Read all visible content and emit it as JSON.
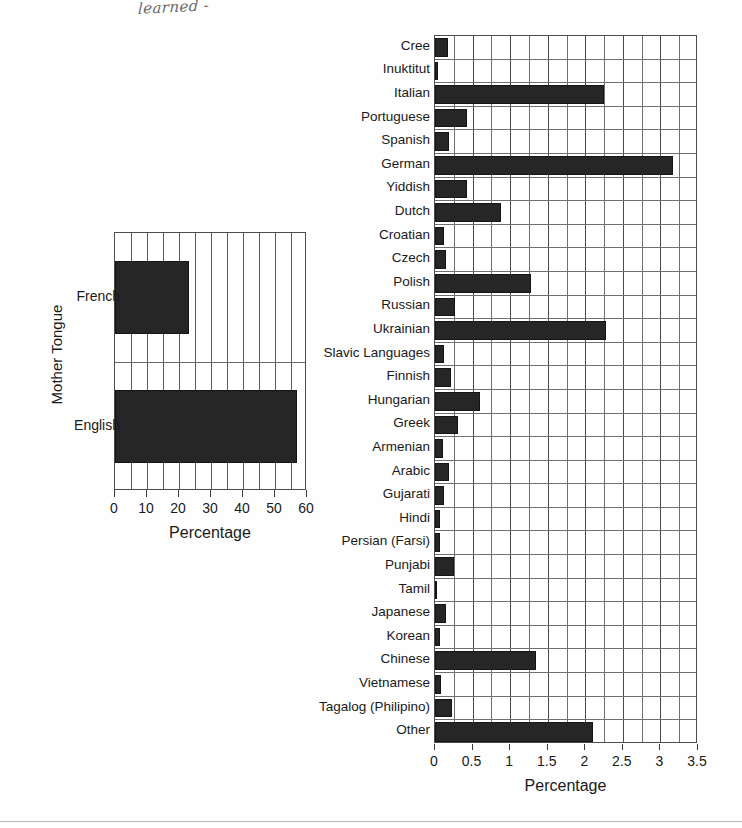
{
  "annotation": {
    "handwritten_note": "learned -"
  },
  "chart_data": [
    {
      "id": "mother-tongue-summary",
      "type": "bar",
      "orientation": "horizontal",
      "title": "",
      "xlabel": "Percentage",
      "ylabel": "Mother Tongue",
      "categories": [
        "French",
        "English"
      ],
      "values": [
        23,
        57
      ],
      "xlim": [
        0,
        60
      ],
      "xticks": [
        0,
        10,
        20,
        30,
        40,
        50,
        60
      ],
      "xtick_labels": [
        "0",
        "10",
        "20",
        "30",
        "40",
        "50",
        "60"
      ],
      "minor_gridline_step": 5,
      "grid": true,
      "legend": "none",
      "bar_color": "#262626"
    },
    {
      "id": "mother-tongue-detail",
      "type": "bar",
      "orientation": "horizontal",
      "title": "",
      "xlabel": "Percentage",
      "ylabel": "",
      "categories": [
        "Cree",
        "Inuktitut",
        "Italian",
        "Portuguese",
        "Spanish",
        "German",
        "Yiddish",
        "Dutch",
        "Croatian",
        "Czech",
        "Polish",
        "Russian",
        "Ukrainian",
        "Slavic Languages",
        "Finnish",
        "Hungarian",
        "Greek",
        "Armenian",
        "Arabic",
        "Gujarati",
        "Hindi",
        "Persian (Farsi)",
        "Punjabi",
        "Tamil",
        "Japanese",
        "Korean",
        "Chinese",
        "Vietnamese",
        "Tagalog (Philipino)",
        "Other"
      ],
      "values": [
        0.17,
        0.04,
        2.25,
        0.42,
        0.18,
        3.17,
        0.43,
        0.88,
        0.12,
        0.15,
        1.28,
        0.27,
        2.27,
        0.12,
        0.21,
        0.6,
        0.3,
        0.1,
        0.18,
        0.12,
        0.06,
        0.07,
        0.25,
        0.03,
        0.15,
        0.07,
        1.35,
        0.08,
        0.22,
        2.1
      ],
      "xlim": [
        0,
        3.5
      ],
      "xticks": [
        0,
        0.5,
        1,
        1.5,
        2,
        2.5,
        3,
        3.5
      ],
      "xtick_labels": [
        "0",
        "0.5",
        "1",
        "1.5",
        "2",
        "2.5",
        "3",
        "3.5"
      ],
      "minor_gridline_step": 0.25,
      "grid": true,
      "legend": "none",
      "bar_color": "#262626"
    }
  ]
}
